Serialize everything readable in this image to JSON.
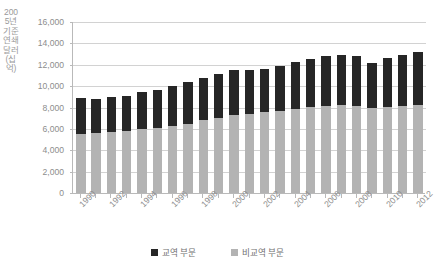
{
  "chart_data": {
    "type": "bar",
    "stacked": true,
    "title": "",
    "xlabel": "",
    "ylabel": "2005년 기준 연쇄달러 (십억)",
    "ylim": [
      0,
      16000
    ],
    "ytick_values": [
      0,
      2000,
      4000,
      6000,
      8000,
      10000,
      12000,
      14000,
      16000
    ],
    "ytick_labels": [
      "0",
      "2,000",
      "4,000",
      "6,000",
      "8,000",
      "10,000",
      "12,000",
      "14,000",
      "16,000"
    ],
    "grid": true,
    "legend_position": "bottom",
    "categories": [
      "1990",
      "1991",
      "1992",
      "1993",
      "1994",
      "1995",
      "1996",
      "1997",
      "1998",
      "1999",
      "2000",
      "2001",
      "2002",
      "2003",
      "2004",
      "2005",
      "2006",
      "2007",
      "2008",
      "2009",
      "2010",
      "2011",
      "2012"
    ],
    "xtick_labels_shown": [
      "1990",
      "1992",
      "1994",
      "1996",
      "1998",
      "2000",
      "2002",
      "2004",
      "2006",
      "2008",
      "2010",
      "2012"
    ],
    "series": [
      {
        "name": "비교역 부문",
        "color": "#b3b3b3",
        "values": [
          5550,
          5600,
          5700,
          5800,
          5950,
          6050,
          6250,
          6500,
          6800,
          7050,
          7300,
          7400,
          7550,
          7700,
          7900,
          8050,
          8150,
          8200,
          8150,
          8000,
          8050,
          8100,
          8200
        ]
      },
      {
        "name": "교역 부문",
        "color": "#262626",
        "values": [
          3300,
          3200,
          3250,
          3300,
          3500,
          3600,
          3750,
          3900,
          3950,
          4050,
          4250,
          4100,
          4100,
          4200,
          4400,
          4500,
          4650,
          4750,
          4700,
          4200,
          4600,
          4800,
          5000
        ]
      }
    ],
    "totals": [
      8850,
      8800,
      8950,
      9100,
      9450,
      9650,
      10000,
      10400,
      10750,
      11100,
      11550,
      11500,
      11650,
      11900,
      12300,
      12550,
      12800,
      12950,
      12850,
      12200,
      12650,
      12900,
      13200
    ]
  },
  "legend": {
    "items": [
      {
        "label": "교역 부문",
        "color": "#262626"
      },
      {
        "label": "비교역 부문",
        "color": "#b3b3b3"
      }
    ]
  },
  "axis": {
    "y_title": "2005년 기준 연쇄달러 (십억)"
  }
}
